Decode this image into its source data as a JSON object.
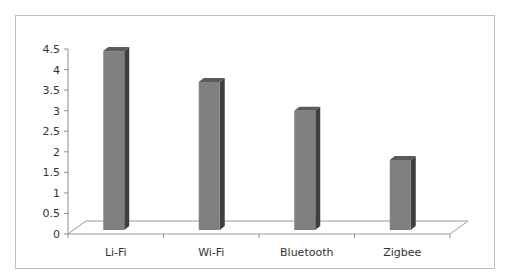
{
  "chart_data": {
    "type": "bar",
    "title": "",
    "xlabel": "",
    "ylabel": "",
    "categories": [
      "Li-Fi",
      "Wi-Fi",
      "Bluetooth",
      "Zigbee"
    ],
    "values": [
      4.45,
      3.7,
      3.0,
      1.8
    ],
    "ylim": [
      0,
      4.5
    ],
    "yticks": [
      "0",
      "0.5",
      "1",
      "1.5",
      "2",
      "2.5",
      "3",
      "3.5",
      "4",
      "4.5"
    ],
    "grid": false,
    "legend": null,
    "style": "3d-column",
    "colors": {
      "front": "#808080",
      "side": "#3f3f3f",
      "top": "#5a5a5a",
      "floor": "#999999",
      "frame": "#bfbfbf"
    }
  }
}
